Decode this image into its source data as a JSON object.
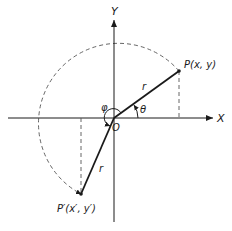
{
  "diagram": {
    "type": "coordinate-rotation",
    "labels": {
      "x_axis": "X",
      "y_axis": "Y",
      "origin": "O",
      "point_p": "P(x, y)",
      "point_p_prime": "P′(x′, y′)",
      "radius_p": "r",
      "radius_p_prime": "r",
      "angle_theta": "θ",
      "angle_phi": "φ"
    },
    "geometry": {
      "origin": [
        114,
        118
      ],
      "p": [
        179,
        71
      ],
      "p_prime": [
        81,
        194
      ],
      "radius": 82
    },
    "colors": {
      "stroke": "#1a1a1a",
      "dashed": "#555555",
      "background": "#ffffff"
    }
  }
}
